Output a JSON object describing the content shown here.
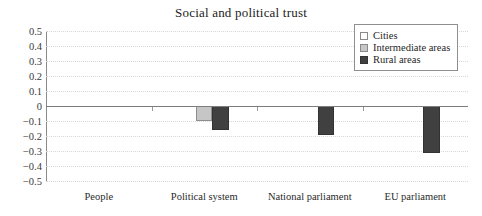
{
  "chart_data": {
    "type": "bar",
    "title": "Social and political trust",
    "xlabel": "",
    "ylabel": "",
    "categories": [
      "People",
      "Political system",
      "National parliament",
      "EU parliament"
    ],
    "series": [
      {
        "name": "Cities",
        "color": "#ffffff",
        "values": [
          0,
          0,
          0,
          0
        ]
      },
      {
        "name": "Intermediate areas",
        "color": "#c6c6c6",
        "values": [
          0,
          -0.1,
          0,
          0
        ]
      },
      {
        "name": "Rural areas",
        "color": "#404040",
        "values": [
          0,
          -0.16,
          -0.19,
          -0.31
        ]
      }
    ],
    "ylim": [
      -0.5,
      0.5
    ],
    "ytick_labels": [
      "0.5",
      "0.4",
      "0.3",
      "0.2",
      "0.1",
      "0",
      "−0.1",
      "−0.2",
      "−0.3",
      "−0.4",
      "−0.5"
    ],
    "ytick_values": [
      0.5,
      0.4,
      0.3,
      0.2,
      0.1,
      0,
      -0.1,
      -0.2,
      -0.3,
      -0.4,
      -0.5
    ],
    "grid": true,
    "grid_axis": "y",
    "legend_position": "top-right",
    "zero_line": true
  },
  "legend": {
    "entries": [
      {
        "label": "Cities"
      },
      {
        "label": "Intermediate areas"
      },
      {
        "label": "Rural areas"
      }
    ]
  }
}
